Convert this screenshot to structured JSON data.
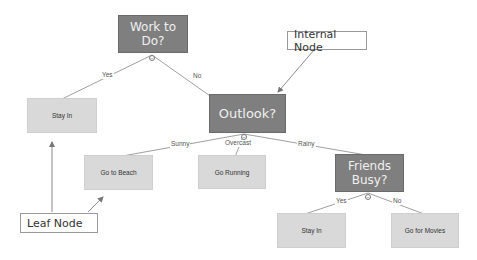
{
  "diagram": {
    "colors": {
      "internal_node_fill": "#7f7f7f",
      "internal_node_text": "#f0f0f0",
      "leaf_node_fill": "#d9d9d9",
      "leaf_node_text": "#333333",
      "edge": "#9a9a9a",
      "callout_border": "#999999"
    },
    "nodes": {
      "work_to_do": {
        "label_line1": "Work to",
        "label_line2": "Do?",
        "type": "internal"
      },
      "outlook": {
        "label": "Outlook?",
        "type": "internal"
      },
      "friends_busy": {
        "label_line1": "Friends",
        "label_line2": "Busy?",
        "type": "internal"
      },
      "stay_in_1": {
        "label": "Stay In",
        "type": "leaf"
      },
      "go_to_beach": {
        "label": "Go to Beach",
        "type": "leaf"
      },
      "go_running": {
        "label": "Go Running",
        "type": "leaf"
      },
      "stay_in_2": {
        "label": "Stay In",
        "type": "leaf"
      },
      "go_for_movies": {
        "label": "Go for Movies",
        "type": "leaf"
      }
    },
    "edges": {
      "work_yes": "Yes",
      "work_no": "No",
      "outlook_sunny": "Sunny",
      "outlook_overcast": "Overcast",
      "outlook_rainy": "Rainy",
      "friends_yes": "Yes",
      "friends_no": "No"
    },
    "callouts": {
      "internal_node": "Internal Node",
      "leaf_node": "Leaf Node"
    },
    "collapse_icon": "⊖"
  }
}
